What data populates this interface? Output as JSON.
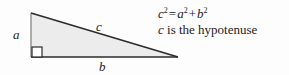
{
  "figure": {
    "background_color": "#fdfdfd"
  },
  "triangle": {
    "fill_color": "#ececec",
    "outline_color": "#2b2b2b",
    "left_edge_color": "#9a9a9a",
    "vertices": {
      "apex": [
        31,
        13
      ],
      "right_angle": [
        31,
        57
      ],
      "right": [
        178,
        57
      ]
    },
    "right_angle_marker": {
      "size": 10,
      "fill": "#ffffff",
      "stroke": "#2b2b2b"
    }
  },
  "labels": {
    "a": "a",
    "b": "b",
    "c": "c"
  },
  "equation": {
    "c": "c",
    "exp_c": "2",
    "equals": "=",
    "a": "a",
    "exp_a": "2",
    "plus": "+",
    "b": "b",
    "exp_b": "2"
  },
  "description": {
    "var": "c",
    "text": " is the hypotenuse"
  }
}
